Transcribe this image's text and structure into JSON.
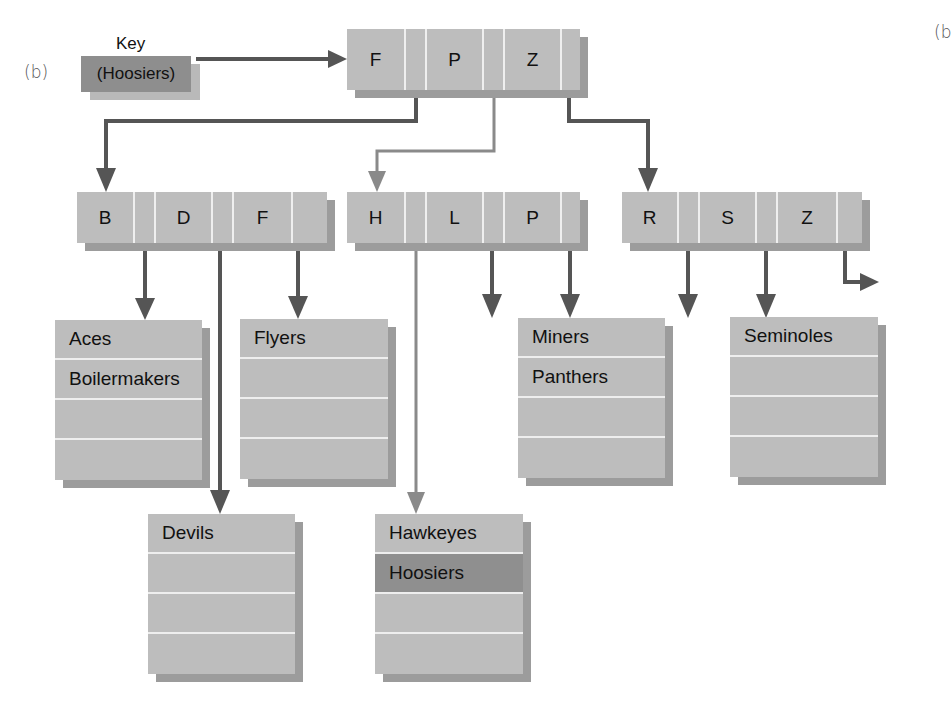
{
  "figure": {
    "panel_label": "(b)",
    "panel_label_right_partial": "(b",
    "key_label": "Key",
    "search_key": "(Hoosiers)",
    "colors": {
      "node_fill": "#bdbdbd",
      "shadow": "#9c9c9c",
      "highlight": "#8f8f8f",
      "dark_arrow": "#555555",
      "light_arrow": "#8a8a8a",
      "separator": "#efefef"
    }
  },
  "root": {
    "keys": [
      "F",
      "P",
      "Z"
    ]
  },
  "level2": [
    {
      "id": "node-bdf",
      "keys": [
        "B",
        "D",
        "F"
      ]
    },
    {
      "id": "node-hlp",
      "keys": [
        "H",
        "L",
        "P"
      ]
    },
    {
      "id": "node-rsz",
      "keys": [
        "R",
        "S",
        "Z"
      ]
    }
  ],
  "leaves": [
    {
      "id": "leaf-aces",
      "rows": [
        "Aces",
        "Boilermakers",
        "",
        ""
      ]
    },
    {
      "id": "leaf-flyers",
      "rows": [
        "Flyers",
        "",
        "",
        ""
      ]
    },
    {
      "id": "leaf-devils",
      "rows": [
        "Devils",
        "",
        "",
        ""
      ]
    },
    {
      "id": "leaf-hawkeyes",
      "rows": [
        "Hawkeyes",
        "Hoosiers",
        "",
        ""
      ],
      "highlight_row": 1
    },
    {
      "id": "leaf-miners",
      "rows": [
        "Miners",
        "Panthers",
        "",
        ""
      ]
    },
    {
      "id": "leaf-seminoles",
      "rows": [
        "Seminoles",
        "",
        "",
        ""
      ]
    }
  ]
}
